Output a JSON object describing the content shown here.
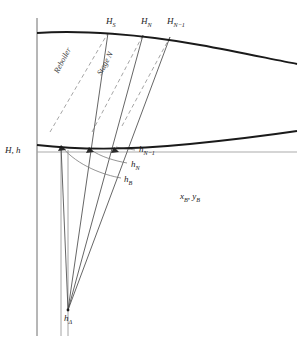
{
  "diagram": {
    "axis_label_y": "H, h",
    "axis_label_x": "",
    "colors": {
      "curve": "#1a1a1a",
      "axis": "#6f6f6f",
      "tie_line": "#555555",
      "dashed_line": "#8a8a8a",
      "reference_line": "#9a9a9a",
      "text": "#1a1a1a"
    },
    "vapor_labels": [
      {
        "id": "HS",
        "base": "H",
        "sub": "S",
        "x": 106,
        "y": 22
      },
      {
        "id": "HN",
        "base": "H",
        "sub": "N",
        "x": 141,
        "y": 22
      },
      {
        "id": "HNm1",
        "base": "H",
        "sub": "N−1",
        "x": 168,
        "y": 22
      }
    ],
    "liquid_labels": [
      {
        "id": "hNm1",
        "base": "h",
        "sub": "N−1",
        "x": 137,
        "y": 149
      },
      {
        "id": "hN",
        "base": "h",
        "sub": "N",
        "x": 130,
        "y": 164
      },
      {
        "id": "hB",
        "base": "h",
        "sub": "B",
        "x": 124,
        "y": 179
      }
    ],
    "composition_label": {
      "text": "x",
      "sub1": "B",
      "sep": ", ",
      "text2": "y",
      "sub2": "B",
      "x": 180,
      "y": 195
    },
    "delta_label": {
      "base": "h",
      "sub": "Δ",
      "x": 66,
      "y": 318
    },
    "rotated_labels": [
      {
        "id": "reboiler",
        "text": "Reboiler",
        "x": 60,
        "y": 72,
        "angle": 62
      },
      {
        "id": "stage-n",
        "text": "Stage N",
        "x": 102,
        "y": 72,
        "angle": 62
      }
    ],
    "curves": {
      "vapor_enthalpy_H": "M37,33 C80,30 140,34 200,45 C240,52 275,60 297,64",
      "liquid_enthalpy_h": "M37,145 C80,150 130,150 190,144 C230,140 270,135 297,131"
    },
    "reference_line_y": 152,
    "axis_x": 37,
    "delta_point": {
      "x": 68,
      "y": 310
    },
    "tie_line_targets": [
      {
        "vapor": {
          "x": 108,
          "y": 33
        },
        "liquid": {
          "x": 61,
          "y": 146
        }
      },
      {
        "vapor": {
          "x": 143,
          "y": 35
        },
        "liquid": {
          "x": 89,
          "y": 148
        }
      },
      {
        "vapor": {
          "x": 170,
          "y": 37
        },
        "liquid": {
          "x": 112,
          "y": 148
        }
      }
    ]
  }
}
